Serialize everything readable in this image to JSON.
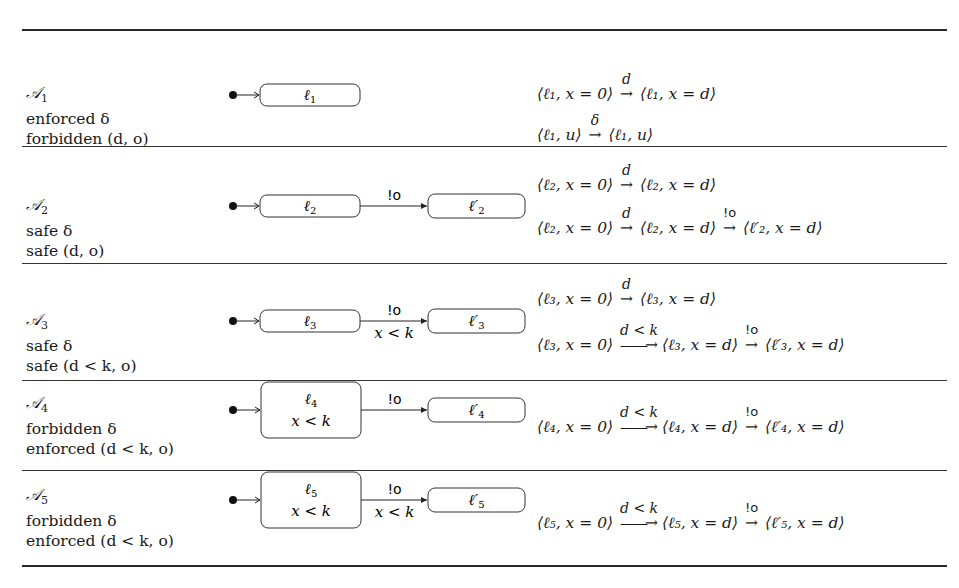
{
  "rows": [
    {
      "automaton": "𝒜",
      "index": "1",
      "line1": "enforced δ",
      "line2": "forbidden (d, o)",
      "states": [
        {
          "name": "ℓ",
          "sub": "1",
          "invariant": ""
        }
      ],
      "transition": null,
      "runs": [
        "⟨ℓ₁, x = 0⟩ —d→ ⟨ℓ₁, x = d⟩",
        "⟨ℓ₁, u⟩ —δ→ ⟨ℓ₁, u⟩"
      ]
    },
    {
      "automaton": "𝒜",
      "index": "2",
      "line1": "safe δ",
      "line2": "safe (d, o)",
      "states": [
        {
          "name": "ℓ",
          "sub": "2",
          "invariant": ""
        },
        {
          "name": "ℓ′",
          "sub": "2",
          "invariant": ""
        }
      ],
      "transition": {
        "action": "!o",
        "guard": ""
      },
      "runs": [
        "⟨ℓ₂, x = 0⟩ —d→ ⟨ℓ₂, x = d⟩",
        "⟨ℓ₂, x = 0⟩ —d→ ⟨ℓ₂, x = d⟩ —!o→ ⟨ℓ′₂, x = d⟩"
      ]
    },
    {
      "automaton": "𝒜",
      "index": "3",
      "line1": "safe δ",
      "line2": "safe (d < k, o)",
      "states": [
        {
          "name": "ℓ",
          "sub": "3",
          "invariant": ""
        },
        {
          "name": "ℓ′",
          "sub": "3",
          "invariant": ""
        }
      ],
      "transition": {
        "action": "!o",
        "guard": "x < k"
      },
      "runs": [
        "⟨ℓ₃, x = 0⟩ —d→ ⟨ℓ₃, x = d⟩",
        "⟨ℓ₃, x = 0⟩ —d < k→ ⟨ℓ₃, x = d⟩ —!o→ ⟨ℓ′₃, x = d⟩"
      ]
    },
    {
      "automaton": "𝒜",
      "index": "4",
      "line1": "forbidden δ",
      "line2": "enforced (d < k, o)",
      "states": [
        {
          "name": "ℓ",
          "sub": "4",
          "invariant": "x < k"
        },
        {
          "name": "ℓ′",
          "sub": "4",
          "invariant": ""
        }
      ],
      "transition": {
        "action": "!o",
        "guard": ""
      },
      "runs": [
        "⟨ℓ₄, x = 0⟩ —d < k→ ⟨ℓ₄, x = d⟩ —!o→ ⟨ℓ′₄, x = d⟩"
      ]
    },
    {
      "automaton": "𝒜",
      "index": "5",
      "line1": "forbidden δ",
      "line2": "enforced (d < k, o)",
      "states": [
        {
          "name": "ℓ",
          "sub": "5",
          "invariant": "x < k"
        },
        {
          "name": "ℓ′",
          "sub": "5",
          "invariant": ""
        }
      ],
      "transition": {
        "action": "!o",
        "guard": "x < k"
      },
      "runs": [
        "⟨ℓ₅, x = 0⟩ —d < k→ ⟨ℓ₅, x = d⟩ —!o→ ⟨ℓ′₅, x = d⟩"
      ]
    }
  ]
}
